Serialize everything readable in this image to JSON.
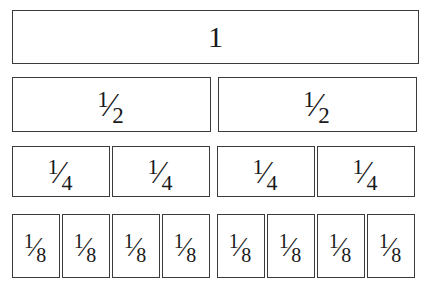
{
  "diagram": {
    "background_color": "#ffffff",
    "border_color": "#3b3b3b",
    "text_color": "#1a1a1a"
  },
  "rows": [
    {
      "name": "whole",
      "denominator": 1,
      "count": 1,
      "cells": [
        {
          "label": "1",
          "numerator": "1",
          "solidus": "",
          "denominator": ""
        }
      ]
    },
    {
      "name": "halves",
      "denominator": 2,
      "count": 2,
      "cells": [
        {
          "label": "1/2",
          "numerator": "1",
          "solidus": "⁄",
          "denominator": "2"
        },
        {
          "label": "1/2",
          "numerator": "1",
          "solidus": "⁄",
          "denominator": "2"
        }
      ]
    },
    {
      "name": "fourths",
      "denominator": 4,
      "count": 4,
      "cells": [
        {
          "label": "1/4",
          "numerator": "1",
          "solidus": "⁄",
          "denominator": "4"
        },
        {
          "label": "1/4",
          "numerator": "1",
          "solidus": "⁄",
          "denominator": "4"
        },
        {
          "label": "1/4",
          "numerator": "1",
          "solidus": "⁄",
          "denominator": "4"
        },
        {
          "label": "1/4",
          "numerator": "1",
          "solidus": "⁄",
          "denominator": "4"
        }
      ]
    },
    {
      "name": "eighths",
      "denominator": 8,
      "count": 8,
      "cells": [
        {
          "label": "1/8",
          "numerator": "1",
          "solidus": "⁄",
          "denominator": "8"
        },
        {
          "label": "1/8",
          "numerator": "1",
          "solidus": "⁄",
          "denominator": "8"
        },
        {
          "label": "1/8",
          "numerator": "1",
          "solidus": "⁄",
          "denominator": "8"
        },
        {
          "label": "1/8",
          "numerator": "1",
          "solidus": "⁄",
          "denominator": "8"
        },
        {
          "label": "1/8",
          "numerator": "1",
          "solidus": "⁄",
          "denominator": "8"
        },
        {
          "label": "1/8",
          "numerator": "1",
          "solidus": "⁄",
          "denominator": "8"
        },
        {
          "label": "1/8",
          "numerator": "1",
          "solidus": "⁄",
          "denominator": "8"
        },
        {
          "label": "1/8",
          "numerator": "1",
          "solidus": "⁄",
          "denominator": "8"
        }
      ]
    }
  ]
}
